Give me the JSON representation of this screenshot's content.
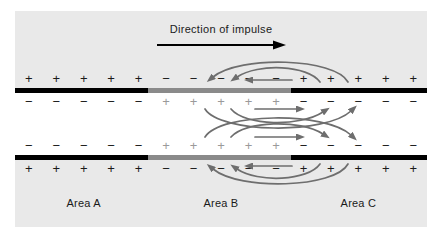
{
  "figure": {
    "title": "Direction of impulse",
    "background_outer": "#e9e9e9",
    "background_inner": "#ffffff",
    "membrane_resting_color": "#000000",
    "membrane_depolarized_color": "#8a8a8a",
    "arrow_color": "#6e6e6e",
    "impulse_arrow_color": "#000000"
  },
  "areas": [
    {
      "label": "Area A",
      "state": "resting"
    },
    {
      "label": "Area B",
      "state": "depolarized"
    },
    {
      "label": "Area C",
      "state": "resting"
    }
  ],
  "membranes": [
    {
      "name": "top",
      "segments": [
        {
          "area": "Area A",
          "color": "#000000"
        },
        {
          "area": "Area B",
          "color": "#8a8a8a"
        },
        {
          "area": "Area C",
          "color": "#000000"
        }
      ]
    },
    {
      "name": "bottom",
      "segments": [
        {
          "area": "Area A",
          "color": "#000000"
        },
        {
          "area": "Area B",
          "color": "#8a8a8a"
        },
        {
          "area": "Area C",
          "color": "#000000"
        }
      ]
    }
  ],
  "charge_rows": [
    {
      "name": "outer-top",
      "side": "extracellular",
      "symbols": [
        "+",
        "+",
        "+",
        "+",
        "+",
        "−",
        "−",
        "−",
        "−",
        "−",
        "+",
        "+",
        "+",
        "+",
        "+"
      ],
      "colors": [
        "#1a1a1a",
        "#1a1a1a",
        "#1a1a1a",
        "#1a1a1a",
        "#1a1a1a",
        "#1a1a1a",
        "#1a1a1a",
        "#1a1a1a",
        "#1a1a1a",
        "#1a1a1a",
        "#1a1a1a",
        "#1a1a1a",
        "#1a1a1a",
        "#1a1a1a",
        "#1a1a1a"
      ]
    },
    {
      "name": "inner-top",
      "side": "intracellular",
      "symbols": [
        "−",
        "−",
        "−",
        "−",
        "−",
        "+",
        "+",
        "+",
        "+",
        "+",
        "−",
        "−",
        "−",
        "−",
        "−"
      ],
      "colors": [
        "#1a1a1a",
        "#1a1a1a",
        "#1a1a1a",
        "#1a1a1a",
        "#1a1a1a",
        "#9a9a9a",
        "#9a9a9a",
        "#9a9a9a",
        "#9a9a9a",
        "#9a9a9a",
        "#1a1a1a",
        "#1a1a1a",
        "#1a1a1a",
        "#1a1a1a",
        "#1a1a1a"
      ]
    },
    {
      "name": "inner-bottom",
      "side": "intracellular",
      "symbols": [
        "−",
        "−",
        "−",
        "−",
        "−",
        "+",
        "+",
        "+",
        "+",
        "+",
        "−",
        "−",
        "−",
        "−",
        "−"
      ],
      "colors": [
        "#1a1a1a",
        "#1a1a1a",
        "#1a1a1a",
        "#1a1a1a",
        "#1a1a1a",
        "#9a9a9a",
        "#9a9a9a",
        "#9a9a9a",
        "#9a9a9a",
        "#9a9a9a",
        "#1a1a1a",
        "#1a1a1a",
        "#1a1a1a",
        "#1a1a1a",
        "#1a1a1a"
      ]
    },
    {
      "name": "outer-bottom",
      "side": "extracellular",
      "symbols": [
        "+",
        "+",
        "+",
        "+",
        "+",
        "−",
        "−",
        "−",
        "−",
        "−",
        "+",
        "+",
        "+",
        "+",
        "+"
      ],
      "colors": [
        "#1a1a1a",
        "#1a1a1a",
        "#1a1a1a",
        "#1a1a1a",
        "#1a1a1a",
        "#1a1a1a",
        "#1a1a1a",
        "#1a1a1a",
        "#1a1a1a",
        "#1a1a1a",
        "#1a1a1a",
        "#1a1a1a",
        "#1a1a1a",
        "#1a1a1a",
        "#1a1a1a"
      ]
    }
  ],
  "current_flows": [
    {
      "region": "extracellular-top",
      "direction": "leftward",
      "count": 3
    },
    {
      "region": "intracellular-upper",
      "direction": "rightward",
      "count": 3
    },
    {
      "region": "intracellular-lower",
      "direction": "rightward",
      "count": 3
    },
    {
      "region": "extracellular-bottom",
      "direction": "leftward",
      "count": 3
    }
  ]
}
